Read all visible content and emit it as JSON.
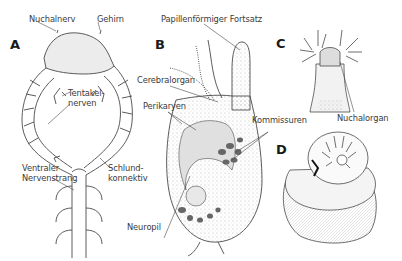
{
  "figure": {
    "panels": [
      {
        "id": "A",
        "label": "A"
      },
      {
        "id": "B",
        "label": "B"
      },
      {
        "id": "C",
        "label": "C"
      },
      {
        "id": "D",
        "label": "D"
      }
    ],
    "labels": {
      "nuchalnerv": "Nuchalnerv",
      "gehirn": "Gehirn",
      "tentakelnerven": "Tentakel-\nnerven",
      "ventraler_nervenstrang": "Ventraler\nNervenstrang",
      "schlundkonnektiv": "Schlund-\nkonnektiv",
      "papillenfoermiger_fortsatz": "Papillenförmiger Fortsatz",
      "cerebralorgan": "Cerebralorgan",
      "perikaryen": "Perikaryen",
      "kommissuren": "Kommissuren",
      "neuropil": "Neuropil",
      "nuchalorgan": "Nuchalorgan"
    },
    "colors": {
      "line": "#4a4a4a",
      "fill_light": "#ececec",
      "fill_mid": "#d8d8d8",
      "dark_spots": "#555555",
      "text": "#3a3a3a"
    }
  }
}
